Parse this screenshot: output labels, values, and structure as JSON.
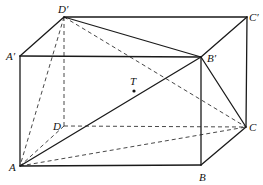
{
  "diagram": {
    "type": "cuboid-geometry",
    "vertices": {
      "A": {
        "label": "A",
        "x": 20,
        "y": 166,
        "lx": 9,
        "ly": 171
      },
      "B": {
        "label": "B",
        "x": 201,
        "y": 165,
        "lx": 199,
        "ly": 181
      },
      "C": {
        "label": "C",
        "x": 246,
        "y": 127,
        "lx": 249,
        "ly": 131
      },
      "D": {
        "label": "D",
        "x": 64,
        "y": 126,
        "lx": 53,
        "ly": 130
      },
      "A1": {
        "label": "A′",
        "x": 20,
        "y": 56,
        "lx": 6,
        "ly": 60
      },
      "B1": {
        "label": "B′",
        "x": 201,
        "y": 57,
        "lx": 207,
        "ly": 62
      },
      "C1": {
        "label": "C′",
        "x": 247,
        "y": 17,
        "lx": 249,
        "ly": 21
      },
      "D1": {
        "label": "D′",
        "x": 64,
        "y": 17,
        "lx": 58,
        "ly": 13
      }
    },
    "point_T": {
      "label": "T",
      "x": 134,
      "y": 91,
      "lx": 130,
      "ly": 85
    },
    "solid_edges": [
      [
        "A",
        "B"
      ],
      [
        "B",
        "C"
      ],
      [
        "C",
        "C1"
      ],
      [
        "C1",
        "D1"
      ],
      [
        "D1",
        "A1"
      ],
      [
        "A1",
        "A"
      ],
      [
        "A1",
        "B1"
      ],
      [
        "B1",
        "B"
      ],
      [
        "B1",
        "C1"
      ],
      [
        "D1",
        "B1"
      ],
      [
        "A",
        "B1"
      ],
      [
        "B1",
        "C"
      ]
    ],
    "dashed_edges": [
      [
        "D",
        "A"
      ],
      [
        "D",
        "C"
      ],
      [
        "D",
        "D1"
      ],
      [
        "D1",
        "A"
      ],
      [
        "D1",
        "C"
      ],
      [
        "A",
        "C"
      ]
    ]
  }
}
